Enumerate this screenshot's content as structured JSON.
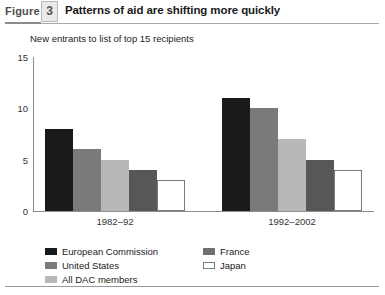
{
  "figure": {
    "label": "Figure",
    "number": "3",
    "title": "Patterns of aid are shifting more quickly"
  },
  "chart_data": {
    "type": "bar",
    "title": "Patterns of aid are shifting more quickly",
    "subtitle": "New entrants to list of top 15 recipients",
    "xlabel": "",
    "ylabel": "",
    "ylim": [
      0,
      15
    ],
    "yticks": [
      0,
      5,
      10,
      15
    ],
    "ytick_labels": [
      "0",
      "5",
      "10",
      "15"
    ],
    "grid": false,
    "legend_position": "bottom",
    "categories": [
      "1982–92",
      "1992–2002"
    ],
    "series": [
      {
        "name": "European Commission",
        "color": "#1a1a1a",
        "values": [
          8,
          11
        ]
      },
      {
        "name": "France",
        "color": "#7a7a7a",
        "values": [
          6,
          10
        ]
      },
      {
        "name": "All DAC members",
        "color": "#b8b8b8",
        "values": [
          5,
          7
        ]
      },
      {
        "name": "United States",
        "color": "#575757",
        "values": [
          4,
          5
        ]
      },
      {
        "name": "Japan",
        "color": "#ffffff",
        "values": [
          3,
          4
        ]
      }
    ]
  },
  "legend": {
    "left": [
      {
        "label": "European Commission",
        "swatch": "c-black"
      },
      {
        "label": "United States",
        "swatch": "c-mid"
      },
      {
        "label": "All DAC members",
        "swatch": "c-light"
      }
    ],
    "right": [
      {
        "label": "France",
        "swatch": "c-dark"
      },
      {
        "label": "Japan",
        "swatch": "c-white"
      }
    ]
  }
}
